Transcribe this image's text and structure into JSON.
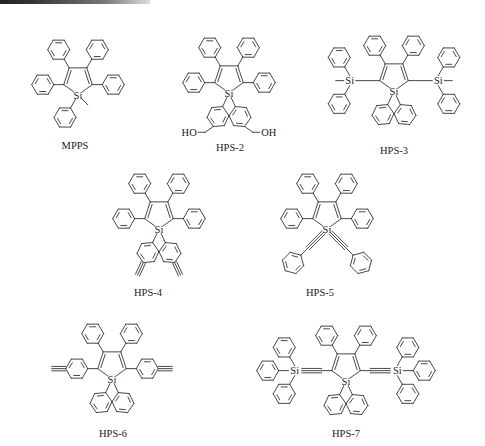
{
  "figure": {
    "type": "chemical-structure-panel",
    "molecules": [
      {
        "id": "mpps",
        "label": "MPPS",
        "si": [
          78,
          95
        ],
        "label_pos": [
          75,
          140
        ],
        "description": "1-methyl-1,2,3,4,5-pentaphenylsilole",
        "substituents": {
          "c2": "phenyl",
          "c3": "phenyl",
          "c4": "phenyl",
          "c5": "phenyl",
          "si_a": "phenyl",
          "si_b": "methyl"
        }
      },
      {
        "id": "hps-2",
        "label": "HPS-2",
        "si": [
          229,
          93
        ],
        "label_pos": [
          230,
          142
        ],
        "description": "1,1-bis(4-hydroxymethylphenyl)-2,3,4,5-tetraphenylsilole",
        "substituents": {
          "c2": "phenyl",
          "c3": "phenyl",
          "c4": "phenyl",
          "c5": "phenyl",
          "si_a": "4-(CH2OH)phenyl",
          "si_b": "4-(CH2OH)phenyl"
        },
        "atom_labels": [
          "HO",
          "OH"
        ]
      },
      {
        "id": "hps-3",
        "label": "HPS-3",
        "si": [
          394,
          91
        ],
        "label_pos": [
          394,
          145
        ],
        "description": "1,1,3,4-tetraphenyl-2,5-bis(methyldiphenylsilyl)silole",
        "substituents": {
          "c2": "SiMePh2",
          "c3": "phenyl",
          "c4": "phenyl",
          "c5": "SiMePh2",
          "si_a": "phenyl",
          "si_b": "phenyl"
        }
      },
      {
        "id": "hps-4",
        "label": "HPS-4",
        "si": [
          159,
          229
        ],
        "label_pos": [
          148,
          287
        ],
        "description": "1,1-bis(4-ethynylphenyl)-2,3,4,5-tetraphenylsilole",
        "substituents": {
          "c2": "phenyl",
          "c3": "phenyl",
          "c4": "phenyl",
          "c5": "phenyl",
          "si_a": "4-ethynylphenyl",
          "si_b": "4-ethynylphenyl"
        }
      },
      {
        "id": "hps-5",
        "label": "HPS-5",
        "si": [
          327,
          229
        ],
        "label_pos": [
          320,
          287
        ],
        "description": "1,1-bis(phenylethynyl)-2,3,4,5-tetraphenylsilole",
        "substituents": {
          "c2": "phenyl",
          "c3": "phenyl",
          "c4": "phenyl",
          "c5": "phenyl",
          "si_a": "phenylethynyl",
          "si_b": "phenylethynyl"
        }
      },
      {
        "id": "hps-6",
        "label": "HPS-6",
        "si": [
          112,
          379
        ],
        "label_pos": [
          113,
          428
        ],
        "description": "2,5-bis(4-ethynylphenyl)-1,1,3,4-tetraphenylsilole",
        "substituents": {
          "c2": "4-ethynylphenyl",
          "c3": "phenyl",
          "c4": "phenyl",
          "c5": "4-ethynylphenyl",
          "si_a": "phenyl",
          "si_b": "phenyl"
        }
      },
      {
        "id": "hps-7",
        "label": "HPS-7",
        "si": [
          346,
          381
        ],
        "label_pos": [
          346,
          428
        ],
        "description": "2,5-bis(triphenylsilylethynyl)-1,1,3,4-tetraphenylsilole",
        "substituents": {
          "c2": "C#C-SiPh3",
          "c3": "phenyl",
          "c4": "phenyl",
          "c5": "C#C-SiPh3",
          "si_a": "phenyl",
          "si_b": "phenyl"
        }
      }
    ],
    "atom_symbols": {
      "silicon": "Si",
      "hydroxyl_left": "HO",
      "hydroxyl_right": "OH"
    }
  }
}
